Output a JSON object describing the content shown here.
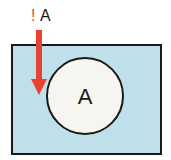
{
  "diagram": {
    "top_label": {
      "prefix": "!",
      "text": "A"
    },
    "circle_label": "A",
    "colors": {
      "universe_fill": "#bfe0ea",
      "circle_fill": "#f7f5f0",
      "stroke": "#1a1a1a",
      "arrow": "#e8432e",
      "prefix": "#e8432e",
      "text": "#1a1a1a"
    }
  }
}
